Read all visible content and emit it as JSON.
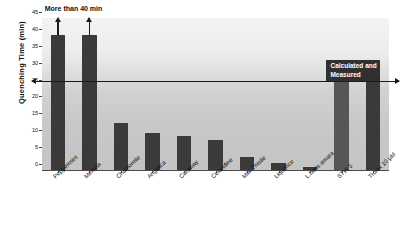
{
  "chart_data": {
    "type": "bar",
    "title": "",
    "xlabel": "",
    "ylabel": "Quenching Time (min)",
    "ylim": [
      0,
      45
    ],
    "yticks": [
      0,
      5,
      10,
      15,
      20,
      25,
      30,
      35,
      40,
      45
    ],
    "grid": false,
    "legend": null,
    "categories": [
      "Peppermint",
      "Melissa",
      "Chamomile",
      "Angelica",
      "Caraway",
      "Celandine",
      "Milk Thistle",
      "Liquorice",
      "L.beris amara",
      "STW 5",
      "Trolox 10 µM"
    ],
    "values": [
      40,
      40,
      14,
      11,
      10,
      9,
      4,
      2,
      1,
      26,
      26
    ],
    "bar_colors": [
      "#3a3a3a",
      "#3a3a3a",
      "#3a3a3a",
      "#3a3a3a",
      "#3a3a3a",
      "#3a3a3a",
      "#3a3a3a",
      "#3a3a3a",
      "#3a3a3a",
      "#565656",
      "#3a3a3a"
    ],
    "truncated_bars": [
      "Peppermint",
      "Melissa"
    ],
    "annotations": [
      {
        "name": "more-than-40-min",
        "text": "More than 40 min",
        "applies_to": [
          "Peppermint",
          "Melissa"
        ]
      },
      {
        "name": "calculated-and-measured",
        "text": "Calculated and\nMeasured",
        "applies_to": [
          "STW 5",
          "Trolox 10 µM"
        ]
      }
    ],
    "reference_line": {
      "name": "threshold-line",
      "y": 26,
      "arrows": "both"
    },
    "colors": {
      "bar_dark": "#3a3a3a",
      "bar_light": "#565656",
      "annotation_box": "#303030",
      "annotation_text": "#ffffff",
      "axis": "#4a4a4a",
      "text": "#111111",
      "plot_background_top": "#f3f3f3",
      "plot_background_bottom": "#c4c4c4"
    }
  }
}
